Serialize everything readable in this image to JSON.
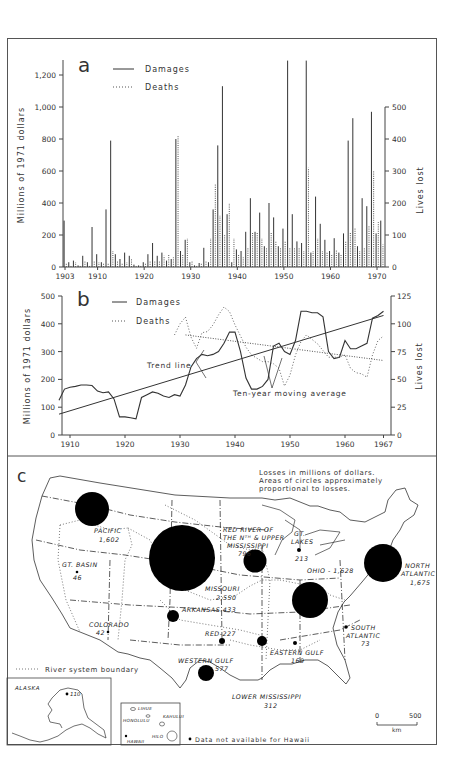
{
  "chart_data": [
    {
      "panel": "a",
      "type": "bar",
      "title": "",
      "panel_label": "a",
      "xlabel": "",
      "ylabel": "Millions of 1971 dollars",
      "ylabel_right": "Lives lost",
      "ylim": [
        0,
        1300
      ],
      "ylim_right": [
        0,
        600
      ],
      "x_ticks": [
        "1903",
        "1910",
        "1920",
        "1930",
        "1940",
        "1950",
        "1960",
        "1970"
      ],
      "y_ticks": [
        "0",
        "200",
        "400",
        "600",
        "800",
        "1,000",
        "1,200"
      ],
      "y_ticks_right": [
        "0",
        "100",
        "200",
        "300",
        "400",
        "500"
      ],
      "legend": [
        {
          "label": "Damages",
          "style": "solid"
        },
        {
          "label": "Deaths",
          "style": "dotted"
        }
      ],
      "grid": false,
      "x": [
        1903,
        1904,
        1905,
        1906,
        1907,
        1908,
        1909,
        1910,
        1911,
        1912,
        1913,
        1914,
        1915,
        1916,
        1917,
        1918,
        1919,
        1920,
        1921,
        1922,
        1923,
        1924,
        1925,
        1926,
        1927,
        1928,
        1929,
        1930,
        1931,
        1932,
        1933,
        1934,
        1935,
        1936,
        1937,
        1938,
        1939,
        1940,
        1941,
        1942,
        1943,
        1944,
        1945,
        1946,
        1947,
        1948,
        1949,
        1950,
        1951,
        1952,
        1953,
        1954,
        1955,
        1956,
        1957,
        1958,
        1959,
        1960,
        1961,
        1962,
        1963,
        1964,
        1965,
        1966,
        1967,
        1968,
        1969,
        1970,
        1971
      ],
      "series": [
        {
          "name": "Damages",
          "unit": "millions of 1971 dollars",
          "values": [
            290,
            30,
            40,
            10,
            70,
            30,
            250,
            80,
            30,
            360,
            790,
            80,
            50,
            90,
            70,
            15,
            10,
            30,
            80,
            150,
            70,
            90,
            40,
            50,
            800,
            100,
            170,
            30,
            10,
            25,
            120,
            30,
            360,
            760,
            1130,
            330,
            30,
            110,
            100,
            220,
            430,
            220,
            340,
            130,
            400,
            310,
            130,
            240,
            1290,
            330,
            160,
            150,
            1290,
            90,
            440,
            270,
            170,
            100,
            180,
            90,
            210,
            790,
            930,
            130,
            430,
            380,
            970,
            210,
            290
          ]
        },
        {
          "name": "Deaths",
          "unit": "lives lost",
          "values": [
            10,
            5,
            15,
            5,
            20,
            5,
            20,
            15,
            10,
            10,
            50,
            20,
            10,
            15,
            25,
            5,
            5,
            10,
            20,
            20,
            20,
            35,
            40,
            30,
            410,
            40,
            90,
            20,
            5,
            10,
            20,
            90,
            260,
            160,
            100,
            200,
            90,
            40,
            30,
            60,
            110,
            110,
            90,
            60,
            110,
            80,
            60,
            80,
            60,
            60,
            60,
            50,
            310,
            50,
            90,
            50,
            45,
            40,
            55,
            40,
            80,
            110,
            120,
            50,
            60,
            130,
            300,
            140,
            70
          ]
        }
      ]
    },
    {
      "panel": "b",
      "type": "line",
      "panel_label": "b",
      "title": "",
      "xlabel": "",
      "ylabel": "Millions of 1971 dollars",
      "ylabel_right": "Lives lost",
      "ylim": [
        0,
        500
      ],
      "ylim_right": [
        0,
        125
      ],
      "x_ticks": [
        "1910",
        "1920",
        "1930",
        "1940",
        "1950",
        "1960",
        "1967"
      ],
      "y_ticks": [
        "0",
        "100",
        "200",
        "300",
        "400",
        "500"
      ],
      "y_ticks_right": [
        "0",
        "25",
        "50",
        "75",
        "100",
        "125"
      ],
      "legend": [
        {
          "label": "Damages",
          "style": "solid"
        },
        {
          "label": "Deaths",
          "style": "dotted"
        }
      ],
      "annotations": [
        "Trend line",
        "Ten-year moving average"
      ],
      "grid": false,
      "x": [
        1908,
        1909,
        1910,
        1911,
        1912,
        1913,
        1914,
        1915,
        1916,
        1917,
        1918,
        1919,
        1920,
        1921,
        1922,
        1923,
        1924,
        1925,
        1926,
        1927,
        1928,
        1929,
        1930,
        1931,
        1932,
        1933,
        1934,
        1935,
        1936,
        1937,
        1938,
        1939,
        1940,
        1941,
        1942,
        1943,
        1944,
        1945,
        1946,
        1947,
        1948,
        1949,
        1950,
        1951,
        1952,
        1953,
        1954,
        1955,
        1956,
        1957,
        1958,
        1959,
        1960,
        1961,
        1962,
        1963,
        1964,
        1965,
        1966,
        1967
      ],
      "series": [
        {
          "name": "Damages (ten-year moving average)",
          "unit": "millions of 1971 dollars",
          "values": [
            125,
            165,
            172,
            175,
            180,
            180,
            178,
            158,
            152,
            155,
            130,
            65,
            65,
            62,
            58,
            135,
            145,
            155,
            150,
            140,
            135,
            145,
            140,
            180,
            245,
            275,
            290,
            285,
            290,
            300,
            330,
            370,
            370,
            300,
            205,
            165,
            165,
            175,
            200,
            320,
            330,
            300,
            290,
            340,
            445,
            445,
            440,
            440,
            425,
            300,
            275,
            280,
            340,
            310,
            310,
            320,
            330,
            420,
            430,
            445
          ]
        },
        {
          "name": "Deaths (ten-year moving average)",
          "unit": "lives lost",
          "values": [
            null,
            null,
            null,
            null,
            null,
            null,
            null,
            null,
            null,
            null,
            null,
            null,
            null,
            null,
            null,
            null,
            null,
            null,
            null,
            null,
            null,
            90,
            100,
            106,
            88,
            78,
            92,
            93,
            99,
            108,
            115,
            111,
            99,
            89,
            79,
            72,
            69,
            66,
            66,
            64,
            60,
            44,
            54,
            72,
            84,
            90,
            86,
            82,
            76,
            70,
            70,
            70,
            72,
            60,
            56,
            55,
            52,
            72,
            85,
            89
          ]
        },
        {
          "name": "Damages trend line",
          "x": [
            1908,
            1967
          ],
          "values": [
            75,
            430
          ]
        },
        {
          "name": "Deaths trend line",
          "x": [
            1931,
            1967
          ],
          "values": [
            90,
            67
          ]
        }
      ]
    },
    {
      "panel": "c",
      "type": "map",
      "panel_label": "c",
      "title": "Losses in millions of dollars. Areas of circles approximately proportional to losses.",
      "legend": [
        {
          "label": "River system boundary",
          "style": "dotted"
        }
      ],
      "regions": [
        {
          "name": "PACIFIC",
          "value": 1602
        },
        {
          "name": "GT. BASIN",
          "value": 46
        },
        {
          "name": "COLORADO",
          "value": 42
        },
        {
          "name": "MISSOURI",
          "value": 2550
        },
        {
          "name": "RED RIVER OF THE Nth & UPPER MISSISSIPPI",
          "value": 796
        },
        {
          "name": "GT. LAKES",
          "value": 213
        },
        {
          "name": "OHIO",
          "value": 1628
        },
        {
          "name": "NORTH ATLANTIC",
          "value": 1675
        },
        {
          "name": "ARKANSAS",
          "value": 433
        },
        {
          "name": "RED",
          "value": 227
        },
        {
          "name": "WESTERN GULF",
          "value": 577
        },
        {
          "name": "LOWER MISSISSIPPI",
          "value": 312
        },
        {
          "name": "EASTERN GULF",
          "value": 169
        },
        {
          "name": "SOUTH ATLANTIC",
          "value": 73
        },
        {
          "name": "ALASKA",
          "value": 110
        }
      ],
      "note": "Data not available for Hawaii",
      "scale": {
        "min": "0",
        "max": "500",
        "unit": "km"
      }
    }
  ],
  "panels": {
    "a": {
      "label": "a",
      "ylabel": "Millions of 1971 dollars",
      "ylabel_right": "Lives lost",
      "legend_damages": "Damages",
      "legend_deaths": "Deaths",
      "x_ticks": [
        "1903",
        "1910",
        "1920",
        "1930",
        "1940",
        "1950",
        "1960",
        "1970"
      ],
      "y_ticks": [
        "0",
        "200",
        "400",
        "600",
        "800",
        "1,000",
        "1,200"
      ],
      "y_ticks_right": [
        "0",
        "100",
        "200",
        "300",
        "400",
        "500"
      ]
    },
    "b": {
      "label": "b",
      "ylabel": "Millions of 1971 dollars",
      "ylabel_right": "Lives lost",
      "legend_damages": "Damages",
      "legend_deaths": "Deaths",
      "trend_label": "Trend line",
      "moving_avg_label": "Ten-year moving average",
      "x_ticks": [
        "1910",
        "1920",
        "1930",
        "1940",
        "1950",
        "1960",
        "1967"
      ],
      "y_ticks": [
        "0",
        "100",
        "200",
        "300",
        "400",
        "500"
      ],
      "y_ticks_right": [
        "0",
        "25",
        "50",
        "75",
        "100",
        "125"
      ]
    },
    "c": {
      "label": "c",
      "caption_line1": "Losses in millions of dollars.",
      "caption_line2": "Areas of circles approximately",
      "caption_line3": "proportional to losses.",
      "legend_boundary": "River system boundary",
      "hawaii_note": "Data not available for Hawaii",
      "scale_min": "0",
      "scale_max": "500",
      "scale_unit": "km",
      "labels": {
        "pacific": "PACIFIC",
        "pacific_val": "1,602",
        "gt_basin": "GT. BASIN",
        "gt_basin_val": "46",
        "colorado": "COLORADO",
        "colorado_val": "42",
        "missouri": "MISSOURI",
        "missouri_val": "2,550",
        "red_river_1": "RED RIVER OF",
        "red_river_2": "THE Nᵀᴴ & UPPER",
        "red_river_3": "MISSISSIPPI",
        "red_river_val": "796",
        "gt_lakes_1": "GT.",
        "gt_lakes_2": "LAKES",
        "gt_lakes_val": "213",
        "ohio": "OHIO - 1,628",
        "north_atlantic_1": "NORTH",
        "north_atlantic_2": "ATLANTIC",
        "north_atlantic_val": "1,675",
        "arkansas": "ARKANSAS 433",
        "red": "RED-227",
        "western_gulf": "WESTERN GULF",
        "western_gulf_val": "577",
        "lower_miss": "LOWER MISSISSIPPI",
        "lower_miss_val": "312",
        "eastern_gulf": "EASTERN GULF",
        "eastern_gulf_val": "169",
        "south_atlantic_1": "SOUTH",
        "south_atlantic_2": "ATLANTIC",
        "south_atlantic_val": "73",
        "alaska": "ALASKA",
        "alaska_val": "110",
        "lihue": "LIHUE",
        "honolulu": "HONOLULU",
        "kahului": "KAHULUI",
        "hilo": "HILO",
        "hawaii": "HAWAII"
      }
    }
  },
  "colors": {
    "ink": "#222222",
    "frame": "#555555",
    "background": "#ffffff"
  }
}
